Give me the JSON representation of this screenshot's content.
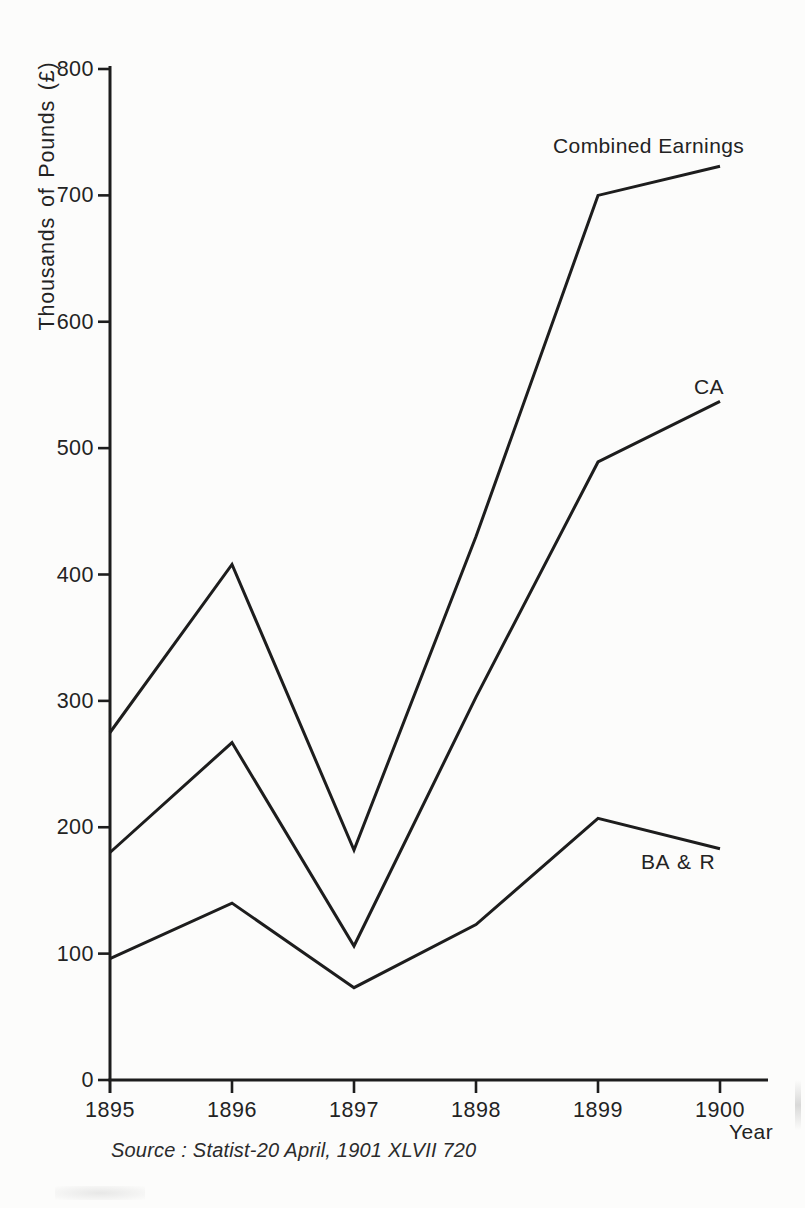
{
  "page": {
    "background": "#fcfcfb",
    "ink": "#1d1d1d",
    "text_color": "#232323"
  },
  "chart_data": {
    "type": "line",
    "title": "",
    "xlabel": "Year",
    "ylabel": "Thousands of Pounds (£)",
    "x": [
      1895,
      1896,
      1897,
      1898,
      1899,
      1900
    ],
    "x_tick_labels": [
      "1895",
      "1896",
      "1897",
      "1898",
      "1899",
      "1900"
    ],
    "y_ticks": [
      0,
      100,
      200,
      300,
      400,
      500,
      600,
      700,
      800
    ],
    "ylim": [
      0,
      800
    ],
    "xlim": [
      1895,
      1900
    ],
    "grid": false,
    "legend_position": "inline-labels-right-of-lines",
    "series": [
      {
        "name": "Combined Earnings",
        "values": [
          275,
          408,
          182,
          430,
          700,
          723
        ]
      },
      {
        "name": "CA",
        "values": [
          180,
          267,
          106,
          303,
          489,
          537
        ]
      },
      {
        "name": "BA & R",
        "values": [
          96,
          140,
          73,
          123,
          207,
          183
        ]
      }
    ],
    "source_note": "Source : Statist-20 April, 1901 XLVII 720"
  }
}
